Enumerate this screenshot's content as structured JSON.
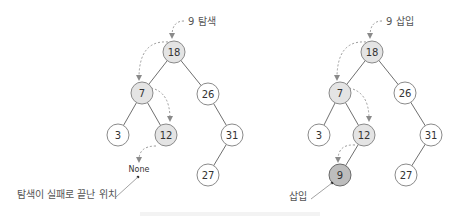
{
  "colors": {
    "plain_fill": "#ffffff",
    "visited_fill": "#e4e4e4",
    "inserted_fill": "#bdbdbd",
    "edge": "#6f6f6f",
    "dashed_arrow": "#9a9a9a"
  },
  "left_tree": {
    "title": "9 탐색",
    "nodes": [
      {
        "key": "18",
        "state": "visited"
      },
      {
        "key": "7",
        "state": "visited"
      },
      {
        "key": "26",
        "state": "plain"
      },
      {
        "key": "3",
        "state": "plain"
      },
      {
        "key": "12",
        "state": "visited"
      },
      {
        "key": "31",
        "state": "plain"
      },
      {
        "key": "27",
        "state": "plain"
      }
    ],
    "none_label": "None",
    "annotation": "탐색이 실패로 끝난 위치"
  },
  "right_tree": {
    "title": "9 삽입",
    "nodes": [
      {
        "key": "18",
        "state": "visited"
      },
      {
        "key": "7",
        "state": "visited"
      },
      {
        "key": "26",
        "state": "plain"
      },
      {
        "key": "3",
        "state": "plain"
      },
      {
        "key": "12",
        "state": "visited"
      },
      {
        "key": "31",
        "state": "plain"
      },
      {
        "key": "27",
        "state": "plain"
      },
      {
        "key": "9",
        "state": "inserted"
      }
    ],
    "annotation": "삽입"
  }
}
